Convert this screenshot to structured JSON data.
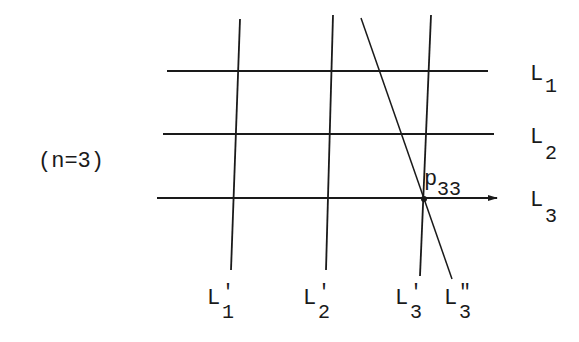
{
  "diagram": {
    "condition_label": "(n=3)",
    "horizontal_lines": [
      {
        "id": "L1",
        "base": "L",
        "sub": "1",
        "y": 71,
        "x1": 167,
        "x2": 488
      },
      {
        "id": "L2",
        "base": "L",
        "sub": "2",
        "y": 134,
        "x1": 163,
        "x2": 494
      },
      {
        "id": "L3",
        "base": "L",
        "sub": "3",
        "y": 198,
        "x1": 157,
        "x2": 497,
        "arrow": true
      }
    ],
    "vertical_lines": [
      {
        "id": "L1prime",
        "base": "L",
        "prime": "'",
        "sub": "1",
        "x1": 240,
        "y1": 19,
        "x2": 231,
        "y2": 270
      },
      {
        "id": "L2prime",
        "base": "L",
        "prime": "'",
        "sub": "2",
        "x1": 333,
        "y1": 15,
        "x2": 326,
        "y2": 270
      },
      {
        "id": "L3prime",
        "base": "L",
        "prime": "'",
        "sub": "3",
        "x1": 431,
        "y1": 15,
        "x2": 420,
        "y2": 276
      },
      {
        "id": "L3doubleprime",
        "base": "L",
        "prime": "\"",
        "sub": "3",
        "x1": 361,
        "y1": 18,
        "x2": 452,
        "y2": 279
      }
    ],
    "point": {
      "base": "p",
      "sub": "33",
      "x": 424,
      "y": 199
    }
  }
}
